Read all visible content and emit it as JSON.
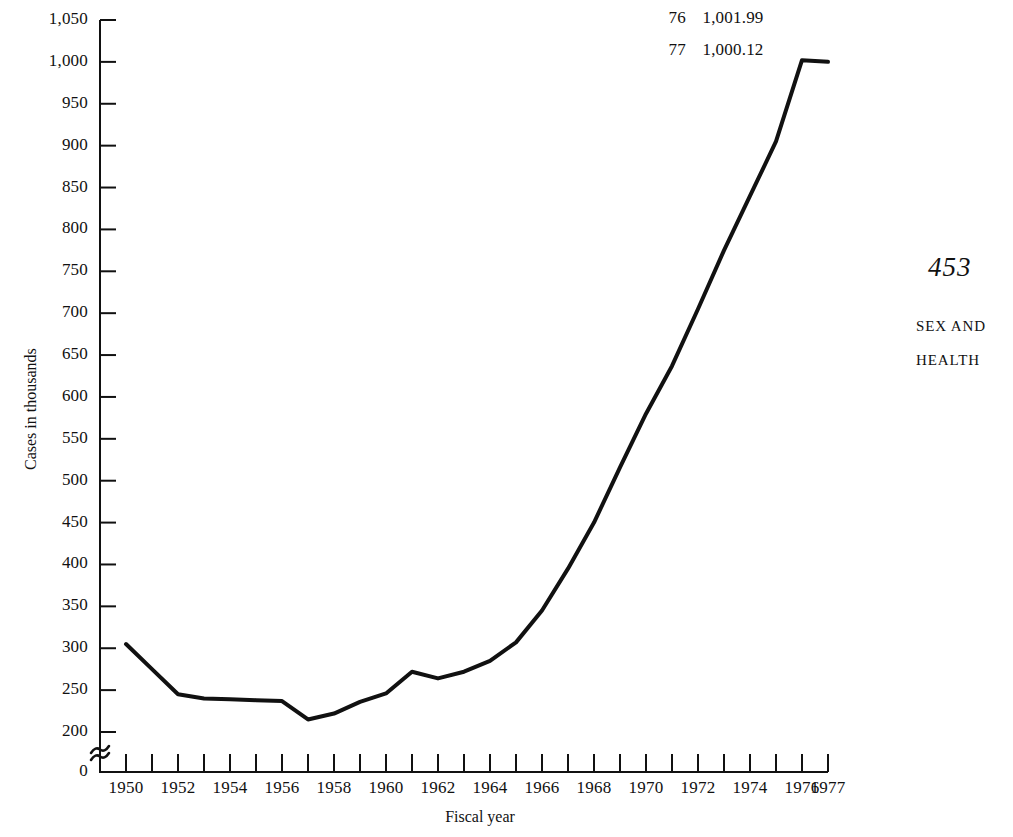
{
  "page": {
    "folio": "453",
    "running_head_line1": "SEX AND",
    "running_head_line2": "HEALTH",
    "background_color": "#ffffff",
    "ink_color": "#111111"
  },
  "chart_data": {
    "type": "line",
    "title": "",
    "subtitle": "",
    "xlabel": "Fiscal year",
    "ylabel": "Cases in thousands",
    "xlim": [
      1949,
      1977
    ],
    "ylim": [
      0,
      1050
    ],
    "y_axis_break": true,
    "y_axis_break_symbol": "≈",
    "y_axis_break_between": [
      0,
      200
    ],
    "grid": false,
    "legend": null,
    "line_color": "#111111",
    "line_width_px": 4,
    "x_tick_interval_years": 1,
    "x_label_interval_years": 2,
    "y_tick_interval": 50,
    "ytick_labels": [
      "1,050",
      "1,000",
      "950",
      "900",
      "850",
      "800",
      "750",
      "700",
      "650",
      "600",
      "550",
      "500",
      "450",
      "400",
      "350",
      "300",
      "250",
      "200",
      "0"
    ],
    "ytick_values": [
      1050,
      1000,
      950,
      900,
      850,
      800,
      750,
      700,
      650,
      600,
      550,
      500,
      450,
      400,
      350,
      300,
      250,
      200,
      0
    ],
    "xtick_labels": [
      "1950",
      "1952",
      "1954",
      "1956",
      "1958",
      "1960",
      "1962",
      "1964",
      "1966",
      "1968",
      "1970",
      "1972",
      "1974",
      "1976",
      "1977"
    ],
    "xtick_values": [
      1950,
      1952,
      1954,
      1956,
      1958,
      1960,
      1962,
      1964,
      1966,
      1968,
      1970,
      1972,
      1974,
      1976,
      1977
    ],
    "x": [
      1950,
      1951,
      1952,
      1953,
      1954,
      1955,
      1956,
      1957,
      1958,
      1959,
      1960,
      1961,
      1962,
      1963,
      1964,
      1965,
      1966,
      1967,
      1968,
      1969,
      1970,
      1971,
      1972,
      1973,
      1974,
      1975,
      1976,
      1977
    ],
    "values": [
      305,
      275,
      245,
      240,
      239,
      238,
      237,
      215,
      222,
      236,
      246,
      272,
      264,
      272,
      285,
      307,
      345,
      395,
      450,
      516,
      580,
      637,
      705,
      775,
      840,
      905,
      1001.99,
      1000.12
    ],
    "annotations": [
      {
        "year_short": "76",
        "value_label": "1,001.99"
      },
      {
        "year_short": "77",
        "value_label": "1,000.12"
      }
    ]
  }
}
